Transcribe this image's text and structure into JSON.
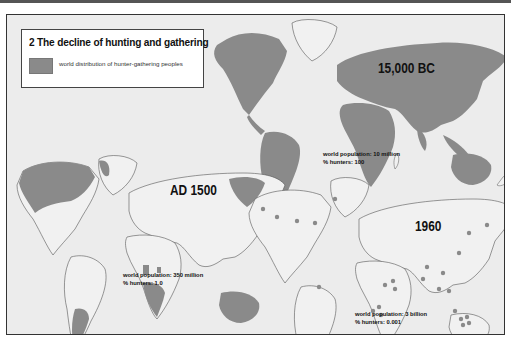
{
  "figure": {
    "title": "2 The decline of hunting and gathering",
    "legend": {
      "swatch_color": "#8a8a8a",
      "label": "world distribution of hunter-gathering peoples"
    }
  },
  "maps": [
    {
      "era_label": "15,000 BC",
      "population": "world population: 10 million",
      "hunters": "% hunters: 100"
    },
    {
      "era_label": "AD 1500",
      "population": "world population: 350 million",
      "hunters": "% hunters: 1.0"
    },
    {
      "era_label": "1960",
      "population": "world population: 3 billion",
      "hunters": "% hunters: 0.001"
    }
  ],
  "colors": {
    "panel_bg": "#ececec",
    "land_fill": "#f1f1f1",
    "hunter_fill": "#8a8a8a",
    "dot": "#8a8a8a",
    "outline": "#555555"
  }
}
